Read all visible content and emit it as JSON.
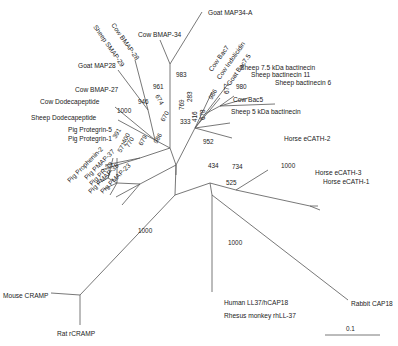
{
  "diagram": {
    "type": "unrooted phylogenetic tree",
    "taxa": {
      "goat_map34a": "Goat MAP34-A",
      "cow_bmap34": "Cow BMAP-34",
      "cow_bmap28": "Cow BMAP-28",
      "sheep_smap29": "Sheep SMAP-29",
      "goat_map28": "Goat MAP28",
      "cow_bmap27": "Cow BMAP-27",
      "cow_dodeca": "Cow Dodecapeptide",
      "sheep_dodeca": "Sheep Dodecapeptide",
      "pig_protegrin5": "Pig Protegrin-5",
      "pig_protegrin1": "Pig Protegrin-1",
      "pig_prophenin2": "Pig Prophenin-2",
      "pig_pmap37": "Pig PMAP-37",
      "pig_pr39": "Pig PR-39",
      "pig_pmap36": "Pig PMAP-36",
      "pig_pmap23": "Pig PMAP-23",
      "cow_bac7": "Cow Bac7",
      "cow_indolicidin": "Cow Indolicidin",
      "goat_bac75": "Goat Bac7.5",
      "sheep_75kda": "Sheep 7.5 kDa bactinecin",
      "sheep_bac11": "Sheep bactinecin 11",
      "sheep_bac6": "Sheep bactinecin 6",
      "cow_bac5": "Cow Bac5",
      "sheep_5kda": "Sheep 5 kDa bactinecin",
      "horse_ecath2": "Horse eCATH-2",
      "horse_ecath3": "Horse eCATH-3",
      "horse_ecath1": "Horse eCATH-1",
      "mouse_cramp": "Mouse CRAMP",
      "rat_rcramp": "Rat rCRAMP",
      "human_ll37": "Human LL37/hCAP18",
      "rhesus_rhll37": "Rhesus monkey rhLL-37",
      "rabbit_cap18": "Rabbit CAP18"
    },
    "bootstrap": {
      "b983": "983",
      "b961": "961",
      "b674": "674",
      "b946": "946",
      "b1000_dodeca": "1000",
      "b670": "670",
      "b769": "769",
      "b283": "283",
      "b416": "416",
      "b678": "678",
      "b986": "986",
      "b677": "677",
      "b980": "980",
      "b333": "333",
      "b391": "391",
      "b400": "400",
      "b770": "770",
      "b571": "571",
      "b679": "679",
      "b986_pig": "986",
      "b952": "952",
      "b434": "434",
      "b734": "734",
      "b1000_horse": "1000",
      "b525": "525",
      "b1000_rodent": "1000",
      "b1000_primate": "1000"
    },
    "scale_bar": {
      "label": "0.1"
    }
  }
}
